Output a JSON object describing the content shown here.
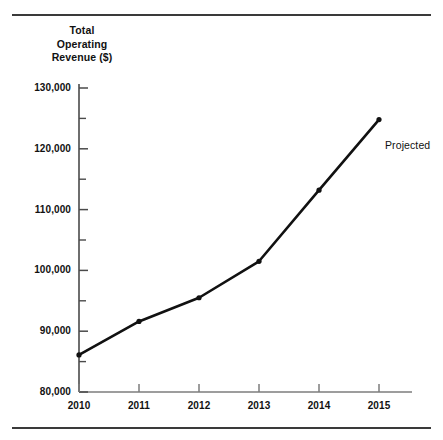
{
  "figure": {
    "has_top_rule": true,
    "has_bottom_rule": true,
    "rule_color": "#3a3a3a",
    "background_color": "#ffffff",
    "line_color": "#111111"
  },
  "chart_data": {
    "type": "line",
    "title": "",
    "subtitle": "",
    "xlabel": "",
    "ylabel": "Total Operating Revenue ($)",
    "ylabel_lines": [
      "Total",
      "Operating",
      "Revenue ($)"
    ],
    "categories": [
      "2010",
      "2011",
      "2012",
      "2013",
      "2014",
      "2015"
    ],
    "x": [
      2010,
      2011,
      2012,
      2013,
      2014,
      2015
    ],
    "values": [
      86100,
      91600,
      95500,
      101500,
      113200,
      124800
    ],
    "series": [
      {
        "name": "Total Operating Revenue ($)",
        "values": [
          86100,
          91600,
          95500,
          101500,
          113200,
          124800
        ]
      }
    ],
    "ylim": [
      80000,
      130000
    ],
    "xlim": [
      2010,
      2015
    ],
    "ytick_labels": [
      "80,000",
      "90,000",
      "100,000",
      "110,000",
      "120,000",
      "130,000"
    ],
    "ytick_values": [
      80000,
      90000,
      100000,
      110000,
      120000,
      130000
    ],
    "yminor_values": [
      85000,
      95000,
      105000,
      115000,
      125000
    ],
    "xtick_labels": [
      "2010",
      "2011",
      "2012",
      "2013",
      "2014",
      "2015"
    ],
    "grid": false,
    "legend": "none",
    "marker": "dot",
    "annotations": [
      {
        "text": "Projected",
        "x": 2015,
        "y": 120500
      }
    ]
  }
}
